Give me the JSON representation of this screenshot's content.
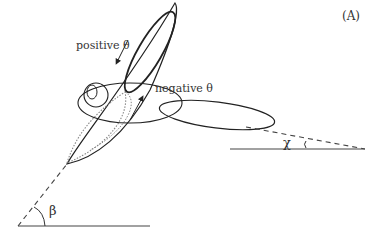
{
  "figure": {
    "panel_label": "(A)",
    "labels": {
      "positive_theta": "positive θ",
      "negative_theta": "negative θ",
      "chi": "χ",
      "beta": "β"
    },
    "colors": {
      "line": "#222222",
      "dotted": "#888888",
      "text": "#333333"
    }
  }
}
